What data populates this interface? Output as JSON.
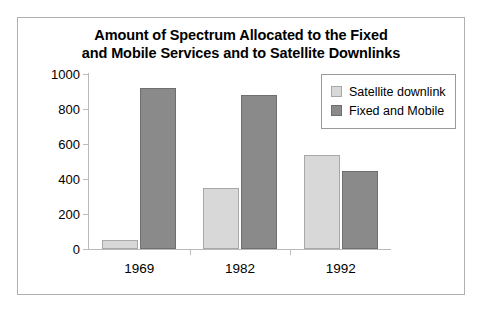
{
  "chart_data": {
    "type": "bar",
    "title": "Amount of Spectrum Allocated to the Fixed and Mobile Services and to Satellite Downlinks",
    "title_lines": [
      "Amount of Spectrum Allocated to the Fixed",
      "and Mobile Services and to Satellite Downlinks"
    ],
    "categories": [
      "1969",
      "1982",
      "1992"
    ],
    "series": [
      {
        "name": "Satellite downlink",
        "values": [
          50,
          350,
          540
        ],
        "color": "#d8d8d8"
      },
      {
        "name": "Fixed and Mobile",
        "values": [
          920,
          880,
          445
        ],
        "color": "#8a8a8a"
      }
    ],
    "xlabel": "",
    "ylabel": "",
    "ylim": [
      0,
      1000
    ],
    "y_ticks": [
      1000,
      800,
      600,
      400,
      200,
      0
    ],
    "grid": false,
    "legend_position": "top-right"
  },
  "legend": {
    "items": [
      {
        "label": "Satellite downlink"
      },
      {
        "label": "Fixed and Mobile"
      }
    ]
  }
}
